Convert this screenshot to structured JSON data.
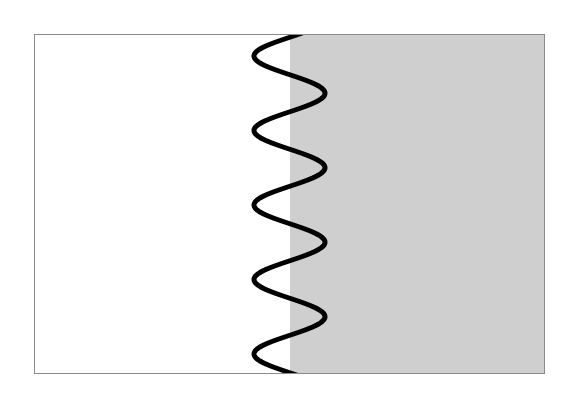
{
  "figure": {
    "rect": {
      "x": 34.5,
      "y": 34.5,
      "width": 510,
      "height": 339
    },
    "border_color": "#8a8a8a",
    "left_region": {
      "fill": "#ffffff"
    },
    "right_region": {
      "fill": "#cfcfcf",
      "start_x": 290
    },
    "wave": {
      "color": "#000000",
      "stroke_width": 5,
      "center_x": 289.5,
      "amplitude": 35.5,
      "top_y": 34,
      "bottom_y": 374,
      "period": 74.5,
      "phase_deg": 15
    }
  }
}
